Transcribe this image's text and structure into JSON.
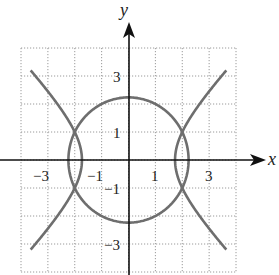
{
  "chart_data": {
    "type": "line",
    "title": "",
    "xlabel": "x",
    "ylabel": "y",
    "xlim": [
      -4,
      4
    ],
    "ylim": [
      -4,
      4
    ],
    "grid": true,
    "grid_style": "dotted",
    "x_ticks": [
      -3,
      -1,
      1,
      3
    ],
    "y_ticks": [
      3,
      1,
      -1,
      -3
    ],
    "x_tick_labels": [
      "−3",
      "−1",
      "1",
      "3"
    ],
    "y_tick_labels": [
      "3",
      "1",
      "−1",
      "−3"
    ],
    "series": [
      {
        "name": "circle",
        "equation": "x^2 + y^2 = 5",
        "radius": 2.236
      },
      {
        "name": "hyperbola",
        "equation": "x^2 - y^2 = 3",
        "vertices": [
          [
            -1.732,
            0
          ],
          [
            1.732,
            0
          ]
        ]
      }
    ],
    "intersections": [
      [
        2,
        1
      ],
      [
        2,
        -1
      ],
      [
        -2,
        1
      ],
      [
        -2,
        -1
      ]
    ],
    "curve_color": "#6e6e6e",
    "axis_color": "#111111",
    "grid_color": "#9a9a9a"
  },
  "labels": {
    "x_axis": "x",
    "y_axis": "y",
    "x_ticks": [
      "−3",
      "−1",
      "1",
      "3"
    ],
    "y_ticks": [
      "3",
      "1",
      "−1",
      "−3"
    ]
  }
}
